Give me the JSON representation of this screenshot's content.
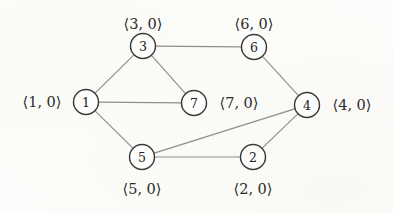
{
  "figure": {
    "kind": "undirected-graph-diagram",
    "background_color": "#fcfcfa",
    "node_stroke_color": "#3a3a3a",
    "edge_stroke_color": "#8e8e8e",
    "text_color": "#2b2b2b",
    "width": 393,
    "height": 213
  },
  "nodes": [
    {
      "id": "1",
      "label": "1",
      "annotation": "⟨1, 0⟩",
      "x": 86,
      "y": 102,
      "r": 12.5,
      "annotation_x": 42,
      "annotation_y": 102
    },
    {
      "id": "2",
      "label": "2",
      "annotation": "⟨2, 0⟩",
      "x": 253,
      "y": 157,
      "r": 12.5,
      "annotation_x": 253,
      "annotation_y": 189
    },
    {
      "id": "3",
      "label": "3",
      "annotation": "⟨3, 0⟩",
      "x": 143,
      "y": 46,
      "r": 12.5,
      "annotation_x": 143,
      "annotation_y": 24
    },
    {
      "id": "4",
      "label": "4",
      "annotation": "⟨4, 0⟩",
      "x": 307,
      "y": 105,
      "r": 12.5,
      "annotation_x": 352,
      "annotation_y": 105
    },
    {
      "id": "5",
      "label": "5",
      "annotation": "⟨5, 0⟩",
      "x": 142,
      "y": 157,
      "r": 12.5,
      "annotation_x": 142,
      "annotation_y": 189
    },
    {
      "id": "6",
      "label": "6",
      "annotation": "⟨6, 0⟩",
      "x": 254,
      "y": 47,
      "r": 12.5,
      "annotation_x": 254,
      "annotation_y": 24
    },
    {
      "id": "7",
      "label": "7",
      "annotation": "⟨7, 0⟩",
      "x": 194,
      "y": 103,
      "r": 12.5,
      "annotation_x": 239,
      "annotation_y": 103
    }
  ],
  "edges": [
    {
      "from": "1",
      "to": "3",
      "x1": 86,
      "y1": 102,
      "x2": 143,
      "y2": 46
    },
    {
      "from": "1",
      "to": "7",
      "x1": 86,
      "y1": 102,
      "x2": 194,
      "y2": 103
    },
    {
      "from": "1",
      "to": "5",
      "x1": 86,
      "y1": 102,
      "x2": 142,
      "y2": 157
    },
    {
      "from": "3",
      "to": "7",
      "x1": 143,
      "y1": 46,
      "x2": 194,
      "y2": 103
    },
    {
      "from": "3",
      "to": "6",
      "x1": 143,
      "y1": 46,
      "x2": 254,
      "y2": 47
    },
    {
      "from": "6",
      "to": "4",
      "x1": 254,
      "y1": 47,
      "x2": 307,
      "y2": 105
    },
    {
      "from": "5",
      "to": "4",
      "x1": 142,
      "y1": 157,
      "x2": 307,
      "y2": 105
    },
    {
      "from": "5",
      "to": "2",
      "x1": 142,
      "y1": 157,
      "x2": 253,
      "y2": 157
    },
    {
      "from": "2",
      "to": "4",
      "x1": 253,
      "y1": 157,
      "x2": 307,
      "y2": 105
    }
  ]
}
